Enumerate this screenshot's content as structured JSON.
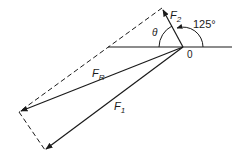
{
  "diagram": {
    "origin_label": "0",
    "vectors": [
      {
        "name": "F1",
        "label": "F",
        "subscript": "1",
        "from": [
          183,
          47
        ],
        "to": [
          45,
          150
        ]
      },
      {
        "name": "F2",
        "label": "F",
        "subscript": "2",
        "from": [
          183,
          47
        ],
        "to": [
          162,
          8
        ]
      },
      {
        "name": "FR",
        "label": "F",
        "subscript": "R",
        "from": [
          183,
          47
        ],
        "to": [
          19,
          112
        ]
      }
    ],
    "angles": [
      {
        "label": "125°",
        "description": "angle between F2 and positive horizontal axis"
      },
      {
        "label": "θ",
        "description": "angle between F2 and negative horizontal axis side"
      }
    ],
    "construction_lines": "dashed parallelogram sides",
    "colors": {
      "stroke": "#1a1a1a",
      "background": "#ffffff"
    }
  }
}
